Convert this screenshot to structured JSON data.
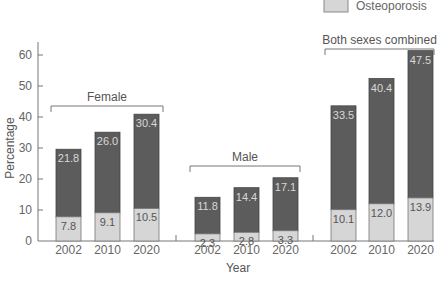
{
  "legend": {
    "items": [
      {
        "label": "Osteoporosis",
        "color": "#d6d6d6"
      }
    ]
  },
  "axes": {
    "ylabel": "Percentage",
    "xlabel": "Year",
    "yticks": [
      "0",
      "10",
      "20",
      "30",
      "40",
      "50",
      "60"
    ]
  },
  "groups": [
    {
      "label": "Female",
      "years": [
        "2002",
        "2010",
        "2020"
      ],
      "dark": [
        "21.8",
        "26.0",
        "30.4"
      ],
      "light": [
        "7.8",
        "9.1",
        "10.5"
      ]
    },
    {
      "label": "Male",
      "years": [
        "2002",
        "2010",
        "2020"
      ],
      "dark": [
        "11.8",
        "14.4",
        "17.1"
      ],
      "light": [
        "2.3",
        "2.8",
        "3.3"
      ]
    },
    {
      "label": "Both sexes combined",
      "years": [
        "2002",
        "2010",
        "2020"
      ],
      "dark": [
        "33.5",
        "40.4",
        "47.5"
      ],
      "light": [
        "10.1",
        "12.0",
        "13.9"
      ]
    }
  ],
  "colors": {
    "dark": "#5c5c5c",
    "light": "#d6d6d6",
    "axis": "#777777"
  },
  "chart_data": {
    "type": "bar",
    "stacked": true,
    "title": "",
    "xlabel": "Year",
    "ylabel": "Percentage",
    "ylim": [
      0,
      65
    ],
    "grid": false,
    "legend_position": "top-right",
    "categories": [
      "Female 2002",
      "Female 2010",
      "Female 2020",
      "Male 2002",
      "Male 2010",
      "Male 2020",
      "Both 2002",
      "Both 2010",
      "Both 2020"
    ],
    "groups": [
      "Female",
      "Male",
      "Both sexes combined"
    ],
    "series": [
      {
        "name": "Osteoporosis",
        "color": "#d6d6d6",
        "values": [
          7.8,
          9.1,
          10.5,
          2.3,
          2.8,
          3.3,
          10.1,
          12.0,
          13.9
        ]
      },
      {
        "name": "(dark segment, unlabeled in legend)",
        "color": "#5c5c5c",
        "values": [
          21.8,
          26.0,
          30.4,
          11.8,
          14.4,
          17.1,
          33.5,
          40.4,
          47.5
        ]
      }
    ]
  }
}
